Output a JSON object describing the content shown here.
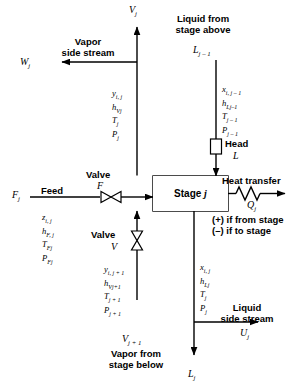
{
  "diagram": {
    "stage_box_label": "Stage",
    "stage_box_index": "j",
    "stroke_color": "#000000",
    "background": "#ffffff"
  },
  "streams": {
    "vapor_out_top": {
      "symbol": "V",
      "subscript": "j",
      "properties": [
        {
          "sym": "y",
          "sub": "i, j"
        },
        {
          "sym": "h",
          "sub": "Vj"
        },
        {
          "sym": "T",
          "sub": "j"
        },
        {
          "sym": "P",
          "sub": "j"
        }
      ]
    },
    "vapor_side_stream": {
      "label_line1": "Vapor",
      "label_line2": "side stream",
      "symbol": "W",
      "subscript": "j"
    },
    "liquid_in_top": {
      "label_line1": "Liquid from",
      "label_line2": "stage above",
      "symbol": "L",
      "subscript": "j – 1",
      "properties": [
        {
          "sym": "x",
          "sub": "i, j – 1"
        },
        {
          "sym": "h",
          "sub": "Lj–1"
        },
        {
          "sym": "T",
          "sub": "j – 1"
        },
        {
          "sym": "P",
          "sub": "j – 1"
        }
      ],
      "restriction_label_line1": "Head",
      "restriction_symbol": "L"
    },
    "feed": {
      "label": "Feed",
      "symbol": "F",
      "subscript": "j",
      "valve_label": "Valve",
      "valve_symbol": "F",
      "properties": [
        {
          "sym": "z",
          "sub": "i, j"
        },
        {
          "sym": "h",
          "sub": "F, j"
        },
        {
          "sym": "T",
          "sub": "Fj"
        },
        {
          "sym": "P",
          "sub": "Fj"
        }
      ]
    },
    "heat_transfer": {
      "label": "Heat transfer",
      "symbol": "Q",
      "subscript": "j",
      "note_line1": "(+) if from stage",
      "note_line2": "(–) if to stage"
    },
    "vapor_in_bottom": {
      "label_line1": "Vapor from",
      "label_line2": "stage below",
      "symbol": "V",
      "subscript": "j + 1",
      "valve_label": "Valve",
      "valve_symbol": "V",
      "properties": [
        {
          "sym": "y",
          "sub": "i, j + 1"
        },
        {
          "sym": "h",
          "sub": "Vj+1"
        },
        {
          "sym": "T",
          "sub": "j + 1"
        },
        {
          "sym": "P",
          "sub": "j + 1"
        }
      ]
    },
    "liquid_out_bottom": {
      "symbol": "L",
      "subscript": "j",
      "properties": [
        {
          "sym": "x",
          "sub": "i, j"
        },
        {
          "sym": "h",
          "sub": "Lj"
        },
        {
          "sym": "T",
          "sub": "j"
        },
        {
          "sym": "P",
          "sub": "j"
        }
      ]
    },
    "liquid_side_stream": {
      "label_line1": "Liquid",
      "label_line2": "side stream",
      "symbol": "U",
      "subscript": "j"
    }
  }
}
